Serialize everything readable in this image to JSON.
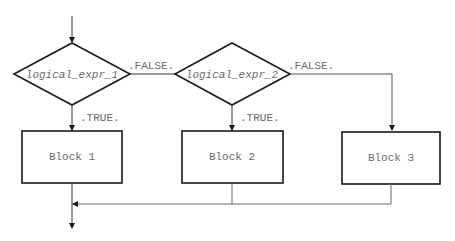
{
  "diagram": {
    "type": "flowchart",
    "decisions": [
      {
        "id": "d1",
        "label": "logical_expr_1",
        "true_label": ".TRUE.",
        "false_label": ".FALSE."
      },
      {
        "id": "d2",
        "label": "logical_expr_2",
        "true_label": ".TRUE.",
        "false_label": ".FALSE."
      }
    ],
    "blocks": [
      {
        "id": "b1",
        "label": "Block 1"
      },
      {
        "id": "b2",
        "label": "Block 2"
      },
      {
        "id": "b3",
        "label": "Block 3"
      }
    ],
    "edges": [
      {
        "from": "entry",
        "to": "d1"
      },
      {
        "from": "d1",
        "to": "b1",
        "label": ".TRUE."
      },
      {
        "from": "d1",
        "to": "d2",
        "label": ".FALSE."
      },
      {
        "from": "d2",
        "to": "b2",
        "label": ".TRUE."
      },
      {
        "from": "d2",
        "to": "b3",
        "label": ".FALSE."
      },
      {
        "from": "b1",
        "to": "exit"
      },
      {
        "from": "b2",
        "to": "exit"
      },
      {
        "from": "b3",
        "to": "exit"
      }
    ],
    "colors": {
      "stroke": "#1a1a1a",
      "connector": "#555555",
      "text": "#6b6b6b",
      "background": "#ffffff"
    }
  }
}
